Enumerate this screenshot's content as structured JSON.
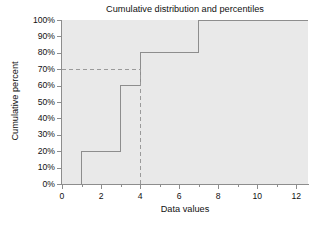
{
  "chart_data": {
    "type": "line",
    "title": "Cumulative distribution and percentiles",
    "xlabel": "Data values",
    "ylabel": "Cumulative percent",
    "xlim": [
      0,
      12.6
    ],
    "ylim": [
      0,
      100
    ],
    "grid": false,
    "legend": null,
    "x_ticks": [
      0,
      2,
      4,
      6,
      8,
      10,
      12
    ],
    "x_tick_labels": [
      "0",
      "2",
      "4",
      "6",
      "8",
      "10",
      "12"
    ],
    "x_minor_ticks": [
      1,
      3,
      5,
      7,
      9,
      11
    ],
    "y_ticks": [
      0,
      10,
      20,
      30,
      40,
      50,
      60,
      70,
      80,
      90,
      100
    ],
    "y_tick_labels": [
      "0%",
      "10%",
      "20%",
      "30%",
      "40%",
      "50%",
      "60%",
      "70%",
      "80%",
      "90%",
      "100%"
    ],
    "series": [
      {
        "name": "Cumulative distribution",
        "style": "step-post",
        "x": [
          1,
          1,
          3,
          3,
          4,
          4,
          7,
          7,
          12.6
        ],
        "y": [
          0,
          20,
          20,
          60,
          60,
          80,
          80,
          100,
          100
        ],
        "steps": [
          {
            "x": 1,
            "percent": 20
          },
          {
            "x": 3,
            "percent": 60
          },
          {
            "x": 4,
            "percent": 80
          },
          {
            "x": 7,
            "percent": 100
          }
        ],
        "color": "#8d8d8d"
      }
    ],
    "reference_lines": [
      {
        "name": "percentile-horizontal",
        "orientation": "horizontal",
        "value": 70,
        "from_x": 0,
        "to_x": 4,
        "style": "dashed",
        "color": "#9a9a9a"
      },
      {
        "name": "percentile-vertical",
        "orientation": "vertical",
        "value": 4,
        "from_y": 0,
        "to_y": 70,
        "style": "dashed",
        "color": "#9a9a9a"
      }
    ],
    "colors": {
      "plot_background": "#e9e9e9",
      "figure_background": "#ffffff",
      "axis": "#8d8d8d",
      "curve": "#8d8d8d",
      "reference": "#9a9a9a",
      "text": "#111111"
    }
  }
}
